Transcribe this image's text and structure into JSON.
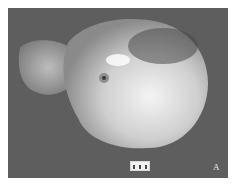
{
  "figure": {
    "panel_label": "A",
    "background_color": "#5e5e5e",
    "scale_bar": {
      "ticks": 3
    }
  }
}
